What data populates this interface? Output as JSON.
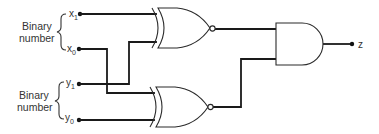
{
  "diagram": {
    "type": "logic-circuit",
    "groups": [
      {
        "label_line1": "Binary",
        "label_line2": "number",
        "inputs": [
          "x1",
          "x0"
        ]
      },
      {
        "label_line1": "Binary",
        "label_line2": "number",
        "inputs": [
          "y1",
          "y0"
        ]
      }
    ],
    "inputs": {
      "x1": {
        "base": "x",
        "sub": "1"
      },
      "x0": {
        "base": "x",
        "sub": "0"
      },
      "y1": {
        "base": "y",
        "sub": "1"
      },
      "y0": {
        "base": "y",
        "sub": "0"
      }
    },
    "gates": [
      {
        "id": "xnor-top",
        "type": "XNOR",
        "inputs": [
          "x1",
          "y1"
        ]
      },
      {
        "id": "xnor-bottom",
        "type": "XNOR",
        "inputs": [
          "x0",
          "y0"
        ]
      },
      {
        "id": "and-out",
        "type": "AND",
        "inputs": [
          "xnor-top",
          "xnor-bottom"
        ]
      }
    ],
    "output": {
      "label": "z"
    }
  }
}
